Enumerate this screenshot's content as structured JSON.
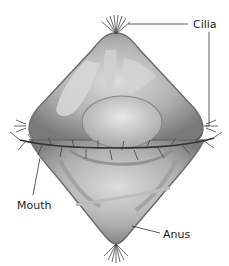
{
  "diagram": {
    "labels": {
      "cilia": "Cilia",
      "mouth": "Mouth",
      "anus": "Anus"
    },
    "colors": {
      "body_fill": "#a9a9a9",
      "body_light": "#d4d4d4",
      "body_dark": "#6e6e6e",
      "cilia": "#444444",
      "leader_line": "#333333",
      "text": "#222222"
    }
  }
}
